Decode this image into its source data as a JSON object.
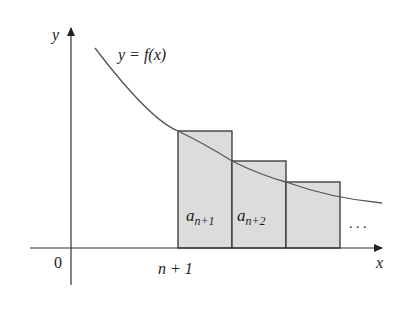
{
  "figure": {
    "y_axis_label": "y",
    "x_axis_label": "x",
    "origin_label": "0",
    "tick_label": "n + 1",
    "curve_label": "y = f(x)",
    "bars": [
      {
        "label_base": "a",
        "label_sub": "n+1"
      },
      {
        "label_base": "a",
        "label_sub": "n+2"
      },
      {
        "label_base": "",
        "label_sub": ""
      }
    ],
    "ellipsis": ". . .",
    "colors": {
      "bar_fill": "#dcdcdc",
      "line": "#333333",
      "curve": "#555555"
    }
  }
}
